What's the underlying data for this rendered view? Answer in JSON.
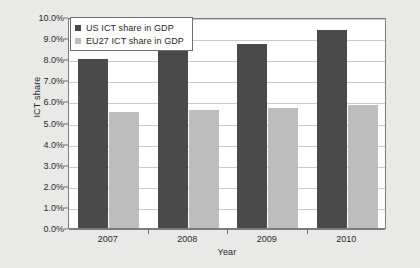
{
  "chart_data": {
    "type": "bar",
    "title": "",
    "xlabel": "Year",
    "ylabel": "ICT share",
    "categories": [
      "2007",
      "2008",
      "2009",
      "2010"
    ],
    "ylim": [
      0,
      10
    ],
    "ytick_labels": [
      "0.0%",
      "1.0%",
      "2.0%",
      "3.0%",
      "4.0%",
      "5.0%",
      "6.0%",
      "7.0%",
      "8.0%",
      "9.0%",
      "10.0%"
    ],
    "ytick_values": [
      0,
      1,
      2,
      3,
      4,
      5,
      6,
      7,
      8,
      9,
      10
    ],
    "grid": true,
    "legend_position": "top-left",
    "series": [
      {
        "name": "US ICT share in GDP",
        "color": "#4a4a4a",
        "values": [
          8.0,
          8.4,
          8.7,
          9.4
        ]
      },
      {
        "name": "EU27 ICT share in GDP",
        "color": "#bdbdbd",
        "values": [
          5.5,
          5.6,
          5.7,
          5.85
        ]
      }
    ]
  }
}
